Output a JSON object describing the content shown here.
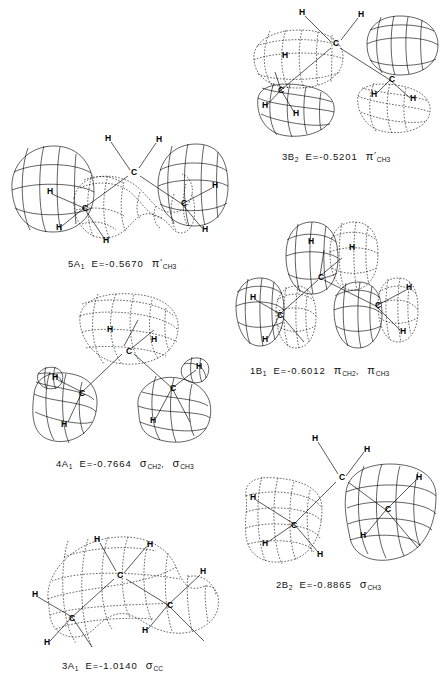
{
  "figure": {
    "type": "molecular-orbital-contour-plots",
    "molecule_atoms": [
      "C",
      "H"
    ],
    "panel_count": 6
  },
  "panels": [
    {
      "id": "3b2",
      "orbital": "3B",
      "orbital_sub": "2",
      "energy_label": "E=-0.5201",
      "energy_value": -0.5201,
      "character": "π",
      "prime": "′",
      "character_sub": "CH",
      "character_sub2": "3",
      "caption_full": "3B2  E=-0.5201  π'CH3",
      "atom_labels": [
        "H",
        "H",
        "C",
        "H",
        "C",
        "H",
        "H",
        "C",
        "H",
        "H"
      ]
    },
    {
      "id": "5a1",
      "orbital": "5A",
      "orbital_sub": "1",
      "energy_label": "E=-0.5670",
      "energy_value": -0.567,
      "character": "π",
      "prime": "′",
      "character_sub": "CH",
      "character_sub2": "3",
      "caption_full": "5A1  E=-0.5670  π'CH3",
      "atom_labels": [
        "H",
        "H",
        "C",
        "H",
        "C",
        "H",
        "H",
        "C",
        "H",
        "H"
      ]
    },
    {
      "id": "1b1",
      "orbital": "1B",
      "orbital_sub": "1",
      "energy_label": "E=-0.6012",
      "energy_value": -0.6012,
      "character": "π",
      "character_sub": "CH",
      "character_sub2": "2",
      "character_b": "π",
      "character_b_sub": "CH",
      "character_b_sub2": "3",
      "separator": ",",
      "caption_full": "1B1  E=-0.6012  πCH2 , πCH3",
      "atom_labels": [
        "H",
        "H",
        "C",
        "C",
        "H",
        "H",
        "C",
        "H",
        "H"
      ]
    },
    {
      "id": "4a1",
      "orbital": "4A",
      "orbital_sub": "1",
      "energy_label": "E=-0.7664",
      "energy_value": -0.7664,
      "character": "σ",
      "character_sub": "CH",
      "character_sub2": "2",
      "character_b": "σ",
      "character_b_sub": "CH",
      "character_b_sub2": "3",
      "separator": ",",
      "caption_full": "4A1  E=-0.7664  σCH2 , σCH3",
      "atom_labels": [
        "H",
        "H",
        "C",
        "H",
        "C",
        "H",
        "C",
        "H",
        "H"
      ]
    },
    {
      "id": "2b2",
      "orbital": "2B",
      "orbital_sub": "2",
      "energy_label": "E=-0.8865",
      "energy_value": -0.8865,
      "character": "σ",
      "character_sub": "CH",
      "character_sub2": "3",
      "caption_full": "2B2  E=-0.8865  σCH3",
      "atom_labels": [
        "H",
        "H",
        "C",
        "H",
        "C",
        "H",
        "H",
        "C",
        "H",
        "H"
      ]
    },
    {
      "id": "3a1",
      "orbital": "3A",
      "orbital_sub": "1",
      "energy_label": "E=-1.0140",
      "energy_value": -1.014,
      "character": "σ",
      "character_sub": "CC",
      "caption_full": "3A1  E=-1.0140  σCC",
      "atom_labels": [
        "H",
        "H",
        "C",
        "H",
        "C",
        "C",
        "H",
        "H",
        "H"
      ]
    }
  ],
  "colors": {
    "ink": "#000000",
    "background": "#ffffff"
  }
}
